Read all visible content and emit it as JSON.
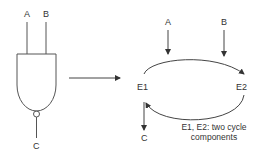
{
  "gate": {
    "type": "NAND",
    "inputs": [
      "A",
      "B"
    ],
    "output": "C"
  },
  "cycle": {
    "nodes": [
      "E1",
      "E2"
    ],
    "inputs": [
      "A",
      "B"
    ],
    "output": "C",
    "note_line1": "E1, E2: two cycle",
    "note_line2": "components"
  },
  "colors": {
    "stroke": "#444444",
    "text": "#333333"
  }
}
